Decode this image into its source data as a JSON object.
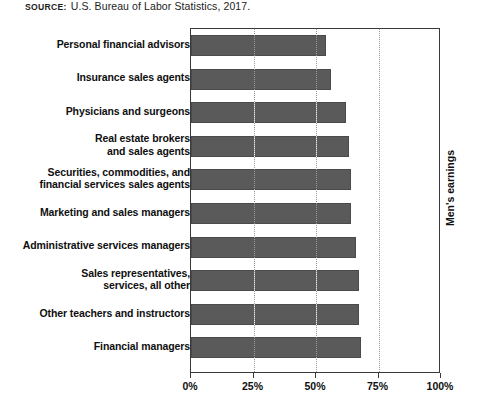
{
  "source": {
    "label": "SOURCE:",
    "text": "U.S. Bureau of Labor Statistics, 2017."
  },
  "axis": {
    "y_right_title": "Men's earnings",
    "x_ticks": [
      "0%",
      "25%",
      "50%",
      "75%",
      "100%"
    ]
  },
  "chart_data": {
    "type": "bar",
    "orientation": "horizontal",
    "title": "",
    "subtitle": "",
    "xlabel": "",
    "ylabel": "Men's earnings",
    "xlim": [
      0,
      100
    ],
    "grid": true,
    "legend": null,
    "units": "percent of men's earnings",
    "categories": [
      "Personal financial advisors",
      "Insurance sales agents",
      "Physicians and surgeons",
      "Real estate brokers\nand sales agents",
      "Securities, commodities, and\nfinancial services sales agents",
      "Marketing and sales managers",
      "Administrative services managers",
      "Sales representatives,\nservices, all other",
      "Other teachers and instructors",
      "Financial managers"
    ],
    "values": [
      54,
      56,
      62,
      63,
      64,
      64,
      66,
      67,
      67,
      68
    ],
    "tick_values": [
      0,
      25,
      50,
      75,
      100
    ],
    "tick_labels": [
      "0%",
      "25%",
      "50%",
      "75%",
      "100%"
    ],
    "bar_color": "#5a5a5a",
    "plot_background": "#ffffff"
  }
}
